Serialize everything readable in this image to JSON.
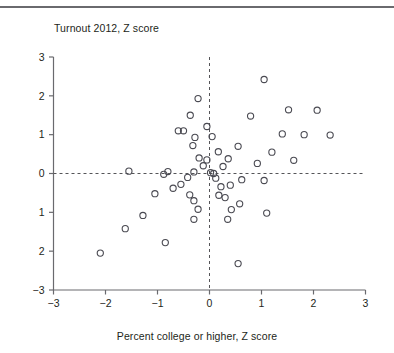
{
  "figure": {
    "top_rule": "horizontal-rule",
    "ylabel": "Turnout 2012, Z score",
    "xlabel": "Percent college or higher, Z score",
    "axis_color": "#6a6a6e",
    "marker_color": "#4a4a52",
    "zero_line_color": "#555558"
  },
  "chart_data": {
    "type": "scatter",
    "title": "",
    "xlabel": "Percent college or higher, Z score",
    "ylabel": "Turnout 2012, Z score",
    "xlim": [
      -3,
      3
    ],
    "ylim": [
      -3,
      3
    ],
    "xticks": [
      -3,
      -2,
      -1,
      0,
      1,
      2,
      3
    ],
    "yticks": [
      3,
      2,
      1,
      0,
      -1,
      -2,
      -3
    ],
    "xtick_labels": [
      "−3",
      "−2",
      "−1",
      "0",
      "1",
      "2",
      "3"
    ],
    "ytick_labels": [
      "3",
      "2",
      "1",
      "0",
      "1",
      "2",
      "−3"
    ],
    "grid": false,
    "legend": false,
    "reference_lines": [
      {
        "axis": "x",
        "value": 0,
        "style": "dashed"
      },
      {
        "axis": "y",
        "value": 0,
        "style": "dashed"
      }
    ],
    "marker": "open-circle",
    "points": [
      [
        1.05,
        2.42
      ],
      [
        -0.22,
        1.93
      ],
      [
        1.52,
        1.64
      ],
      [
        2.07,
        1.63
      ],
      [
        -0.37,
        1.5
      ],
      [
        0.79,
        1.48
      ],
      [
        -0.05,
        1.21
      ],
      [
        -0.6,
        1.1
      ],
      [
        -0.5,
        1.1
      ],
      [
        1.4,
        1.02
      ],
      [
        1.82,
        1.0
      ],
      [
        2.32,
        0.99
      ],
      [
        0.05,
        0.95
      ],
      [
        -0.28,
        0.93
      ],
      [
        -0.32,
        0.72
      ],
      [
        0.55,
        0.7
      ],
      [
        0.17,
        0.56
      ],
      [
        1.2,
        0.55
      ],
      [
        -0.2,
        0.4
      ],
      [
        0.36,
        0.38
      ],
      [
        -0.05,
        0.35
      ],
      [
        1.62,
        0.34
      ],
      [
        0.92,
        0.26
      ],
      [
        -0.12,
        0.2
      ],
      [
        0.26,
        0.18
      ],
      [
        -1.55,
        0.06
      ],
      [
        -0.8,
        0.05
      ],
      [
        -0.3,
        0.04
      ],
      [
        0.02,
        0.02
      ],
      [
        0.08,
        0.0
      ],
      [
        -0.88,
        -0.02
      ],
      [
        -0.42,
        -0.1
      ],
      [
        0.12,
        -0.12
      ],
      [
        0.62,
        -0.16
      ],
      [
        1.05,
        -0.18
      ],
      [
        -0.55,
        -0.28
      ],
      [
        -0.7,
        -0.38
      ],
      [
        0.22,
        -0.34
      ],
      [
        0.4,
        -0.3
      ],
      [
        -1.05,
        -0.52
      ],
      [
        -0.38,
        -0.55
      ],
      [
        0.18,
        -0.56
      ],
      [
        0.3,
        -0.62
      ],
      [
        -0.3,
        -0.7
      ],
      [
        0.58,
        -0.78
      ],
      [
        -0.22,
        -0.92
      ],
      [
        0.42,
        -0.93
      ],
      [
        -1.28,
        -1.08
      ],
      [
        -0.3,
        -1.18
      ],
      [
        0.35,
        -1.18
      ],
      [
        1.1,
        -1.02
      ],
      [
        -1.62,
        -1.42
      ],
      [
        -0.85,
        -1.78
      ],
      [
        -2.1,
        -2.05
      ],
      [
        0.55,
        -2.32
      ]
    ]
  }
}
